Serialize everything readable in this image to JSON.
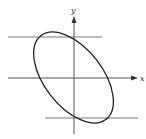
{
  "figure": {
    "axes": {
      "x_label": "x",
      "y_label": "y"
    },
    "curve": {
      "type": "ellipse",
      "orientation": "major axis from upper-left to lower-right"
    },
    "tangent_lines": [
      {
        "position": "top",
        "orientation": "horizontal"
      },
      {
        "position": "bottom",
        "orientation": "horizontal"
      }
    ],
    "colors": {
      "curve": "#222222",
      "lines": "#666666",
      "axes": "#444444"
    }
  }
}
